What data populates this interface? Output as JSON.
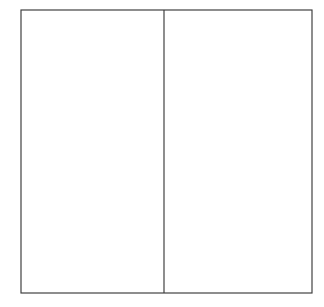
{
  "canvas": {
    "width": 324,
    "height": 307,
    "background_color": "#ffffff",
    "title": "Two-panel rectangle line drawing"
  },
  "style": {
    "stroke_color": "#3a3a3a",
    "stroke_width": 1.15,
    "panel_fill": "#ffffff"
  },
  "diagram": {
    "type": "line-drawing",
    "outer_rect": {
      "name": "outer-frame",
      "x": 21,
      "y": 10,
      "width": 291,
      "height": 283,
      "left": 21,
      "top": 10,
      "right": 312,
      "bottom": 293
    },
    "divider": {
      "name": "vertical-divider",
      "orientation": "vertical",
      "x": 164,
      "y_start": 10,
      "y_end": 293
    },
    "panels": [
      {
        "name": "left-panel",
        "x": 21,
        "y": 10,
        "width": 143,
        "height": 283,
        "fill": "#ffffff",
        "content": ""
      },
      {
        "name": "right-panel",
        "x": 164,
        "y": 10,
        "width": 148,
        "height": 283,
        "fill": "#ffffff",
        "content": ""
      }
    ]
  }
}
